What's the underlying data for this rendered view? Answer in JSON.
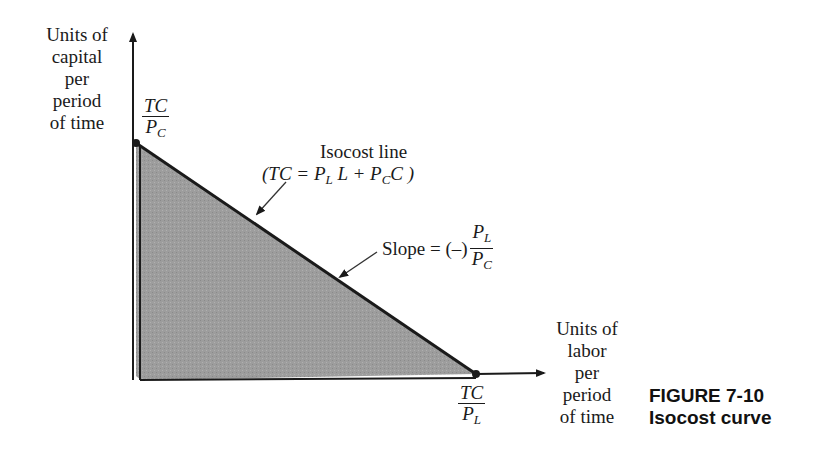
{
  "figure": {
    "number": "FIGURE 7-10",
    "title": "Isocost curve"
  },
  "axes": {
    "y_label": [
      "Units of",
      "capital",
      "per",
      "period",
      "of time"
    ],
    "x_label": [
      "Units of",
      "labor",
      "per",
      "period",
      "of time"
    ],
    "y_intercept": {
      "num": "TC",
      "den_base": "P",
      "den_sub": "C"
    },
    "x_intercept": {
      "num": "TC",
      "den_base": "P",
      "den_sub": "L"
    }
  },
  "annotations": {
    "isocost": {
      "line1": "Isocost line",
      "eq_open": "(TC = P",
      "eq_sub1": "L",
      "eq_mid": " L + P",
      "eq_sub2": "C",
      "eq_close": "C )"
    },
    "slope": {
      "prefix": "Slope = (–)",
      "num_base": "P",
      "num_sub": "L",
      "den_base": "P",
      "den_sub": "C"
    }
  },
  "colors": {
    "fill": "#9a9a9a",
    "line": "#1a1a1a",
    "background": "#ffffff"
  }
}
